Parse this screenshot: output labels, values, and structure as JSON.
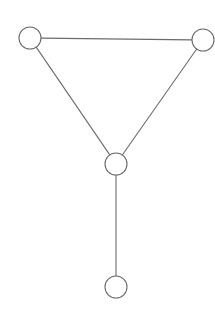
{
  "canvas": {
    "width": 215,
    "height": 311,
    "background": "#ffffff"
  },
  "style": {
    "node_stroke": "#6b6b6b",
    "node_fill": "#ffffff",
    "node_stroke_width": 1.1,
    "node_radius": 11,
    "edge_stroke": "#6b6b6b",
    "edge_stroke_width": 1.1
  },
  "chart_data": {
    "type": "diagram",
    "diagram_kind": "undirected-graph",
    "title": "",
    "nodes": [
      {
        "id": "n1",
        "label": "",
        "x": 30,
        "y": 38,
        "r": 11
      },
      {
        "id": "n2",
        "label": "",
        "x": 203,
        "y": 40,
        "r": 11
      },
      {
        "id": "n3",
        "label": "",
        "x": 116,
        "y": 164,
        "r": 11
      },
      {
        "id": "n4",
        "label": "",
        "x": 116,
        "y": 287,
        "r": 11
      }
    ],
    "edges": [
      {
        "id": "e1",
        "source": "n1",
        "target": "n2"
      },
      {
        "id": "e2",
        "source": "n1",
        "target": "n3"
      },
      {
        "id": "e3",
        "source": "n2",
        "target": "n3"
      },
      {
        "id": "e4",
        "source": "n3",
        "target": "n4"
      }
    ],
    "node_count": 4,
    "edge_count": 4
  }
}
